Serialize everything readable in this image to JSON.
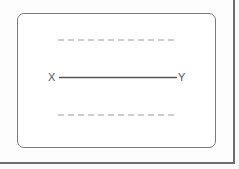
{
  "diagram": {
    "start_label": "X",
    "end_label": "Y",
    "guide_lines": [
      "top-dashed-guide",
      "bottom-dashed-guide"
    ],
    "colors": {
      "line": "#555555",
      "dashes": "#bdbdbd",
      "frame": "#7a7a7a"
    }
  }
}
